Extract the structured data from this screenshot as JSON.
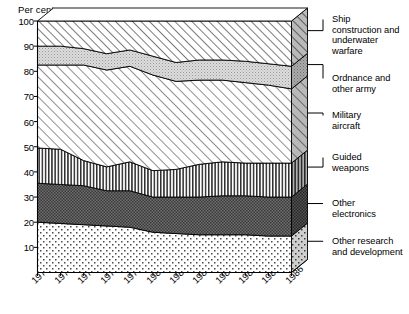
{
  "axis": {
    "y_title": "Per cent",
    "y_ticks": [
      "100",
      "90",
      "80",
      "70",
      "60",
      "50",
      "40",
      "30",
      "20",
      "10"
    ],
    "x_ticks": [
      "1975",
      "1976",
      "1977",
      "1978",
      "1979",
      "1980",
      "1981",
      "1982",
      "1983",
      "1984",
      "1985",
      "1986"
    ]
  },
  "legend": {
    "items": [
      {
        "label": "Ship\nconstruction and\nunderwater\nwarfare",
        "pattern": "diagonal-hatch-right"
      },
      {
        "label": "Ordnance and\nother army",
        "pattern": "fine-stipple-light"
      },
      {
        "label": "Military\naircraft",
        "pattern": "diagonal-hatch-right-sparse"
      },
      {
        "label": "Guided\nweapons",
        "pattern": "vertical-stripes"
      },
      {
        "label": "Other\nelectronics",
        "pattern": "dark-checker"
      },
      {
        "label": "Other research\nand development",
        "pattern": "light-dots"
      }
    ]
  },
  "chart_data": {
    "type": "area",
    "title": "",
    "xlabel": "",
    "ylabel": "Per cent",
    "ylim": [
      0,
      100
    ],
    "grid": false,
    "stacked": true,
    "legend_position": "right",
    "x": [
      "1975",
      "1976",
      "1977",
      "1978",
      "1979",
      "1980",
      "1981",
      "1982",
      "1983",
      "1984",
      "1985",
      "1986"
    ],
    "series": [
      {
        "name": "Other research and development",
        "values": [
          20.0,
          19.5,
          19.0,
          18.5,
          18.0,
          16.0,
          15.5,
          15.0,
          15.0,
          15.0,
          14.5,
          14.5
        ]
      },
      {
        "name": "Other electronics",
        "values": [
          15.5,
          15.5,
          15.5,
          14.0,
          14.5,
          14.0,
          14.5,
          15.0,
          15.5,
          15.5,
          15.5,
          15.5
        ]
      },
      {
        "name": "Guided weapons",
        "values": [
          14.0,
          14.0,
          10.0,
          9.5,
          11.5,
          10.5,
          11.0,
          13.0,
          13.5,
          13.0,
          13.5,
          13.5
        ]
      },
      {
        "name": "Military aircraft",
        "values": [
          33.0,
          33.5,
          38.0,
          38.5,
          38.0,
          38.0,
          35.0,
          33.5,
          32.5,
          32.0,
          31.0,
          29.5
        ]
      },
      {
        "name": "Ordnance and other army",
        "values": [
          7.5,
          7.5,
          6.5,
          6.5,
          6.5,
          7.5,
          7.5,
          8.0,
          8.0,
          8.5,
          8.5,
          9.0
        ]
      },
      {
        "name": "Ship construction and underwater warfare",
        "values": [
          10.0,
          10.0,
          11.0,
          13.0,
          11.5,
          14.0,
          16.5,
          15.5,
          15.5,
          16.0,
          17.0,
          18.0
        ]
      }
    ],
    "cumulative_boundaries": {
      "note": "upper edge of each stacked band, bottom-up",
      "other_rnd": [
        20.0,
        19.5,
        19.0,
        18.5,
        18.0,
        16.0,
        15.5,
        15.0,
        15.0,
        15.0,
        14.5,
        14.5
      ],
      "other_electronics": [
        35.5,
        35.0,
        34.5,
        32.5,
        32.5,
        30.0,
        30.0,
        30.0,
        30.5,
        30.5,
        30.0,
        30.0
      ],
      "guided_weapons": [
        49.5,
        49.0,
        44.5,
        42.0,
        44.0,
        40.5,
        41.0,
        43.0,
        44.0,
        43.5,
        43.5,
        43.5
      ],
      "military_aircraft": [
        82.5,
        82.5,
        82.5,
        80.5,
        82.0,
        78.5,
        76.0,
        76.5,
        76.5,
        75.5,
        74.5,
        73.0
      ],
      "ordnance": [
        90.0,
        90.0,
        89.0,
        87.0,
        88.5,
        86.0,
        83.5,
        84.5,
        84.5,
        84.0,
        83.0,
        82.0
      ],
      "ship_construction": [
        100,
        100,
        100,
        100,
        100,
        100,
        100,
        100,
        100,
        100,
        100,
        100
      ]
    }
  }
}
